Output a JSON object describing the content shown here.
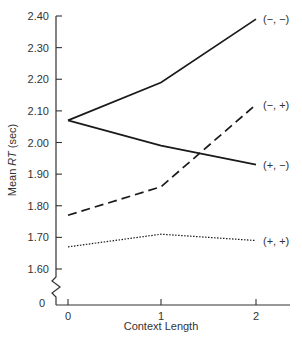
{
  "chart_data": {
    "type": "line",
    "title": "",
    "xlabel": "Context Length",
    "ylabel": "Mean RT (sec)",
    "ylabel_parts": {
      "pre": "Mean ",
      "italic": "RT",
      "post": " (sec)"
    },
    "x": [
      0,
      1,
      2
    ],
    "x_tick_labels": [
      "0",
      "1",
      "2"
    ],
    "y_tick_values": [
      1.6,
      1.7,
      1.8,
      1.9,
      2.0,
      2.1,
      2.2,
      2.3,
      2.4
    ],
    "y_tick_labels": [
      "1.60",
      "1.70",
      "1.80",
      "1.90",
      "2.00",
      "2.10",
      "2.20",
      "2.30",
      "2.40"
    ],
    "y_zero_label": "0",
    "ylim": [
      1.6,
      2.4
    ],
    "axis_break": true,
    "grid": false,
    "legend_position": "inline-right",
    "series": [
      {
        "name": "(−, −)",
        "style": "solid",
        "values": [
          2.07,
          2.19,
          2.39
        ]
      },
      {
        "name": "(−, +)",
        "style": "dashed",
        "values": [
          1.77,
          1.86,
          2.12
        ]
      },
      {
        "name": "(+, −)",
        "style": "solid",
        "values": [
          2.07,
          1.99,
          1.93
        ]
      },
      {
        "name": "(+, +)",
        "style": "dotted",
        "values": [
          1.67,
          1.71,
          1.69
        ]
      }
    ]
  }
}
